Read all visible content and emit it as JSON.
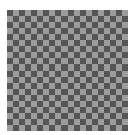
{
  "image": {
    "description": "Gray checkerboard pattern",
    "board": {
      "rows": 20,
      "cols": 20,
      "x": 7,
      "y": 10,
      "width": 121,
      "height": 121
    },
    "colors": {
      "background": "#ffffff",
      "dark": "#555555",
      "light": "#9c9c9c"
    }
  }
}
